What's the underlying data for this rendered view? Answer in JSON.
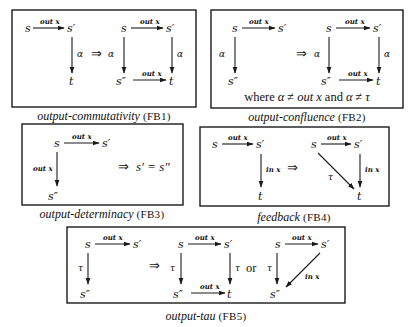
{
  "figure": {
    "rules": [
      {
        "id": "FB1",
        "name": "output-commutativity",
        "code": "(FB1)",
        "lhs": {
          "nodes": {
            "s": "s",
            "s1": "s′",
            "t": "t"
          },
          "edges": [
            {
              "from": "s",
              "to": "s′",
              "label": "out x"
            },
            {
              "from": "s′",
              "to": "t",
              "label": "α"
            }
          ]
        },
        "implies": "⇒",
        "rhs": {
          "nodes": {
            "s": "s",
            "s1": "s′",
            "s2": "s″",
            "t": "t"
          },
          "edges": [
            {
              "from": "s",
              "to": "s′",
              "label": "out x"
            },
            {
              "from": "s",
              "to": "s″",
              "label": "α"
            },
            {
              "from": "s′",
              "to": "t",
              "label": "α"
            },
            {
              "from": "s″",
              "to": "t",
              "label": "out x"
            }
          ]
        }
      },
      {
        "id": "FB2",
        "name": "output-confluence",
        "code": "(FB2)",
        "lhs": {
          "nodes": {
            "s": "s",
            "s1": "s′",
            "s2": "s″"
          },
          "edges": [
            {
              "from": "s",
              "to": "s′",
              "label": "out x"
            },
            {
              "from": "s",
              "to": "s″",
              "label": "α"
            }
          ]
        },
        "implies": "⇒",
        "rhs": {
          "nodes": {
            "s": "s",
            "s1": "s′",
            "s2": "s″",
            "t": "t"
          },
          "edges": [
            {
              "from": "s",
              "to": "s′",
              "label": "out x"
            },
            {
              "from": "s",
              "to": "s″",
              "label": "α"
            },
            {
              "from": "s′",
              "to": "t",
              "label": "α"
            },
            {
              "from": "s″",
              "to": "t",
              "label": "out x"
            }
          ]
        },
        "condition": {
          "where": "where",
          "alpha": "α",
          "neq": "≠",
          "outx": "out x",
          "and": "and",
          "tau": "τ"
        }
      },
      {
        "id": "FB3",
        "name": "output-determinacy",
        "code": "(FB3)",
        "lhs": {
          "nodes": {
            "s": "s",
            "s1": "s′",
            "s2": "s″"
          },
          "edges": [
            {
              "from": "s",
              "to": "s′",
              "label": "out x"
            },
            {
              "from": "s",
              "to": "s″",
              "label": "out x"
            }
          ]
        },
        "implies": "⇒",
        "conclusion": {
          "left": "s′",
          "eq": "=",
          "right": "s″"
        }
      },
      {
        "id": "FB4",
        "name": "feedback",
        "code": "(FB4)",
        "lhs": {
          "nodes": {
            "s": "s",
            "s1": "s′",
            "t": "t"
          },
          "edges": [
            {
              "from": "s",
              "to": "s′",
              "label": "out x"
            },
            {
              "from": "s′",
              "to": "t",
              "label": "in x"
            }
          ]
        },
        "implies": "⇒",
        "rhs": {
          "nodes": {
            "s": "s",
            "s1": "s′",
            "t": "t"
          },
          "edges": [
            {
              "from": "s",
              "to": "s′",
              "label": "out x"
            },
            {
              "from": "s′",
              "to": "t",
              "label": "in x"
            },
            {
              "from": "s",
              "to": "t",
              "label": "τ"
            }
          ]
        }
      },
      {
        "id": "FB5",
        "name": "output-tau",
        "code": "(FB5)",
        "lhs": {
          "nodes": {
            "s": "s",
            "s1": "s′",
            "s2": "s″"
          },
          "edges": [
            {
              "from": "s",
              "to": "s′",
              "label": "out x"
            },
            {
              "from": "s",
              "to": "s″",
              "label": "τ"
            }
          ]
        },
        "implies": "⇒",
        "rhs": {
          "nodes": {
            "s": "s",
            "s1": "s′",
            "s2": "s″",
            "t": "t"
          },
          "edges": [
            {
              "from": "s",
              "to": "s′",
              "label": "out x"
            },
            {
              "from": "s",
              "to": "s″",
              "label": "τ"
            },
            {
              "from": "s′",
              "to": "t",
              "label": "τ"
            },
            {
              "from": "s″",
              "to": "t",
              "label": "out x"
            }
          ]
        },
        "or": "or",
        "rhs2": {
          "nodes": {
            "s": "s",
            "s1": "s′",
            "s2": "s″"
          },
          "edges": [
            {
              "from": "s",
              "to": "s′",
              "label": "out x"
            },
            {
              "from": "s",
              "to": "s″",
              "label": "τ"
            },
            {
              "from": "s′",
              "to": "s″",
              "label": "in x"
            }
          ]
        }
      }
    ]
  }
}
